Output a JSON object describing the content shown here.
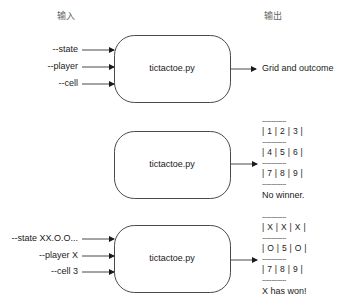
{
  "headers": {
    "input": "输入",
    "output": "输出"
  },
  "diagrams": [
    {
      "args": [
        "--state",
        "--player",
        "--cell"
      ],
      "box_label": "tictactoe.py",
      "output": "Grid and outcome"
    },
    {
      "args": [],
      "box_label": "tictactoe.py",
      "grid": {
        "separator": "-------------",
        "rows": [
          "| 1 | 2 | 3 |",
          "| 4 | 5 | 6 |",
          "| 7 | 8 | 9 |"
        ],
        "outcome": "No winner."
      }
    },
    {
      "args": [
        "--state XX.O.O...",
        "--player X",
        "--cell 3"
      ],
      "box_label": "tictactoe.py",
      "grid": {
        "separator": "-------------",
        "rows": [
          "| X | X | X |",
          "| O | 5 | O |",
          "| 7 | 8 | 9 |"
        ],
        "outcome": "X has won!"
      }
    }
  ],
  "colors": {
    "stroke": "#1a1a1a",
    "text": "#1a1a1a",
    "header": "#666666"
  }
}
